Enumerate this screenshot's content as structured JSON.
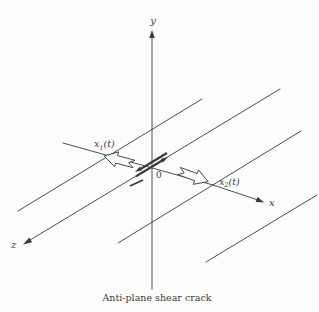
{
  "figure": {
    "caption": "Anti-plane shear crack",
    "axes": {
      "y": "y",
      "x": "x",
      "z": "z",
      "origin": "0"
    },
    "labels": {
      "x1": {
        "base": "x",
        "sub": "1",
        "rest": "(t)"
      },
      "x2": {
        "base": "x",
        "sub": "2",
        "rest": "(t)"
      }
    },
    "colors": {
      "line": "#3b3b3b",
      "background": "#fcfcfc"
    }
  }
}
